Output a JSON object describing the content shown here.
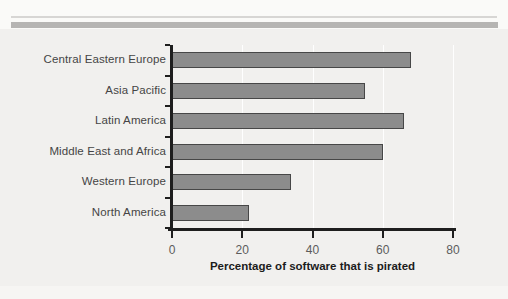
{
  "page": {
    "background": "#f1f0ee",
    "top_thin_rule_color": "#d7d6d4",
    "top_band_rule_color": "#b6b5b3"
  },
  "chart_data": {
    "type": "bar",
    "orientation": "horizontal",
    "title": "",
    "xlabel": "Percentage of software that is pirated",
    "ylabel": "",
    "categories": [
      "Central Eastern Europe",
      "Asia Pacific",
      "Latin America",
      "Middle East and Africa",
      "Western Europe",
      "North America"
    ],
    "values": [
      68,
      55,
      66,
      60,
      34,
      22
    ],
    "xlim": [
      0,
      80
    ],
    "xticks": [
      0,
      20,
      40,
      60,
      80
    ],
    "grid": "faint white vertical gridlines at each x tick",
    "legend": "none",
    "bar_fill_color": "#8c8c8c",
    "bar_border_color": "#474747",
    "axis_color": "#1e1e1e",
    "tick_label_color": "#5c5c5c",
    "category_label_color": "#454545"
  }
}
